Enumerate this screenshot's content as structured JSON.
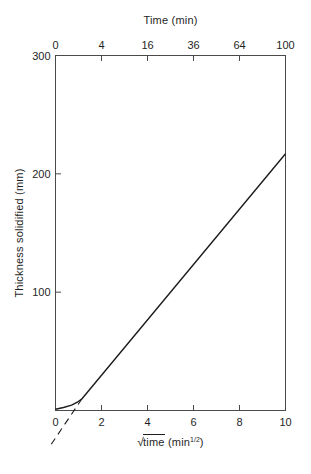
{
  "chart_data": {
    "type": "line",
    "top_axis_title": "Time (min)",
    "ylabel": "Thickness solidified (mm)",
    "xlabel": {
      "radical": "√",
      "radicand": "time",
      "unit_prefix": " (min",
      "unit_sup": "1/2",
      "unit_suffix": ")"
    },
    "xlim": [
      0,
      10
    ],
    "ylim": [
      0,
      300
    ],
    "x_ticks_bottom": [
      0,
      2,
      4,
      6,
      8,
      10
    ],
    "top_axis_ticks": {
      "labels": [
        "0",
        "4",
        "16",
        "36",
        "64",
        "100"
      ],
      "positions": [
        0,
        2,
        4,
        6,
        8,
        10
      ]
    },
    "y_ticks": [
      100,
      200,
      300
    ],
    "grid": false,
    "legend": false,
    "axis_color": "#4a4a4a",
    "line_color": "#1c1c1c",
    "series": [
      {
        "name": "thickness-solidified",
        "style": "solid",
        "points": [
          [
            0,
            1
          ],
          [
            0.35,
            2.5
          ],
          [
            0.7,
            4.5
          ],
          [
            0.95,
            7
          ],
          [
            1.15,
            10
          ],
          [
            10,
            217
          ]
        ]
      },
      {
        "name": "linear-extrapolation",
        "style": "dashed",
        "points": [
          [
            1.15,
            10
          ],
          [
            -0.27,
            -31
          ]
        ]
      }
    ]
  }
}
